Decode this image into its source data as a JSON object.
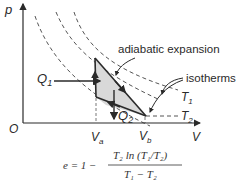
{
  "diagram": {
    "axes": {
      "y_label": "p",
      "x_label": "V",
      "origin_label": "O"
    },
    "volumes": {
      "va": {
        "main": "V",
        "sub": "a"
      },
      "vb": {
        "main": "V",
        "sub": "b"
      }
    },
    "heat": {
      "q1": {
        "main": "Q",
        "sub": "1"
      },
      "q2": {
        "main": "Q",
        "sub": "2"
      }
    },
    "isotherms": {
      "t1": {
        "main": "T",
        "sub": "1"
      },
      "t2": {
        "main": "T",
        "sub": "2"
      }
    },
    "annotations": {
      "adiabatic": "adiabatic expansion",
      "isotherms": "isotherms"
    },
    "formula": {
      "lhs": "e = 1 −",
      "numerator": "T₂ ln (T₁/T₂)",
      "denominator": "T₁ − T₂"
    },
    "colors": {
      "line": "#2a2a2a",
      "dashed": "#555555",
      "fill": "#d9d9d9"
    }
  }
}
